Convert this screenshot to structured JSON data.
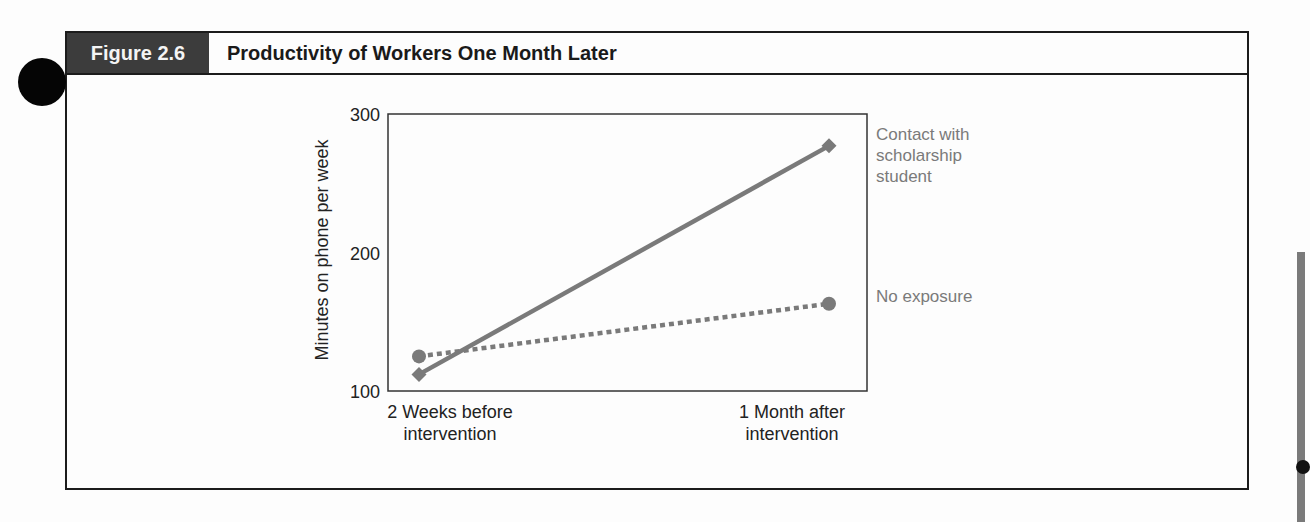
{
  "figure": {
    "label": "Figure 2.6",
    "title": "Productivity of Workers One Month Later"
  },
  "chart_data": {
    "type": "line",
    "title": "Productivity of Workers One Month Later",
    "xlabel": "",
    "ylabel": "Minutes on phone per week",
    "categories": [
      "2 Weeks before intervention",
      "1 Month after intervention"
    ],
    "category_lines": [
      [
        "2 Weeks before",
        "intervention"
      ],
      [
        "1 Month after",
        "intervention"
      ]
    ],
    "yticks": [
      100,
      200,
      300
    ],
    "ylim": [
      100,
      300
    ],
    "grid": false,
    "legend_position": "right, inline labels",
    "series": [
      {
        "name": "Contact with scholarship student",
        "label_lines": [
          "Contact with",
          "scholarship",
          "student"
        ],
        "values": [
          112,
          277
        ],
        "marker": "diamond",
        "line_style": "solid",
        "color": "#7a7a7a"
      },
      {
        "name": "No exposure",
        "label_lines": [
          "No exposure"
        ],
        "values": [
          125,
          163
        ],
        "marker": "circle",
        "line_style": "dashed",
        "color": "#7a7a7a"
      }
    ]
  }
}
